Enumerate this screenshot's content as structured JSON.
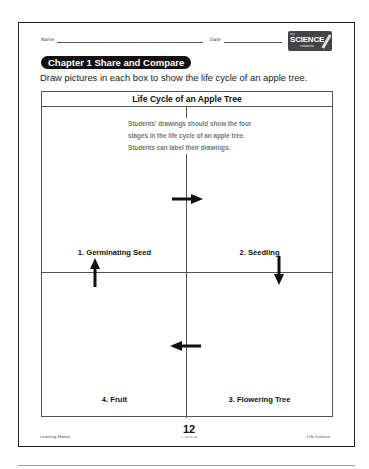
{
  "header": {
    "name_label": "Name",
    "date_label": "Date",
    "logo": {
      "small_top": "my",
      "main": "SCIENCE",
      "small_bottom": "notebook"
    }
  },
  "chapter_badge": "Chapter 1  Share and Compare",
  "instructions": "Draw pictures in each box to show the life cycle of an apple tree.",
  "grid": {
    "title": "Life Cycle of an Apple Tree",
    "answer_note": [
      "Students' drawings should show the four",
      "stages in the life cycle of an apple tree.",
      "Students can label their drawings."
    ],
    "cells": [
      {
        "label": "1.  Germinating Seed"
      },
      {
        "label": "2.  Seedling"
      },
      {
        "label": "3.  Flowering Tree"
      },
      {
        "label": "4.  Fruit"
      }
    ],
    "arrows": [
      "right",
      "down",
      "left",
      "up"
    ]
  },
  "footer": {
    "left": "Learning Master",
    "page_number": "12",
    "code": "© HSP B-HB",
    "right": "Life Science"
  }
}
